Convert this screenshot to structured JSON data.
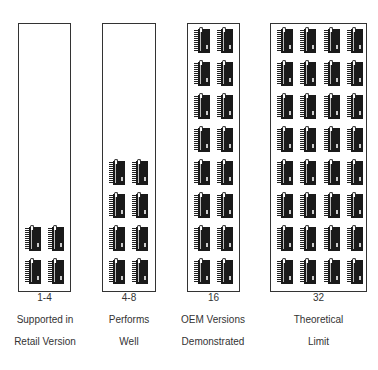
{
  "icon": "processor-chip-icon",
  "columns": [
    {
      "count_label": "1-4",
      "chips": 4,
      "chip_cols": 2,
      "caption_line1": "Supported in",
      "caption_line2": "Retail Version"
    },
    {
      "count_label": "4-8",
      "chips": 8,
      "chip_cols": 2,
      "caption_line1": "Performs",
      "caption_line2": "Well"
    },
    {
      "count_label": "16",
      "chips": 16,
      "chip_cols": 2,
      "caption_line1": "OEM Versions",
      "caption_line2": "Demonstrated"
    },
    {
      "count_label": "32",
      "chips": 32,
      "chip_cols": 4,
      "caption_line1": "Theoretical",
      "caption_line2": "Limit"
    }
  ]
}
